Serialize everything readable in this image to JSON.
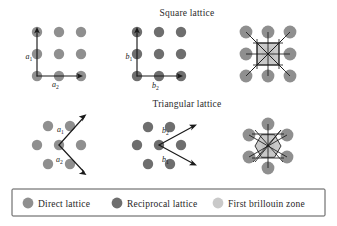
{
  "figure": {
    "width": 337,
    "height": 226,
    "background": "#ffffff"
  },
  "titles": {
    "square": "Square lattice",
    "triangular": "Triangular lattice"
  },
  "colors": {
    "direct_lattice": "#8f8f8f",
    "reciprocal_lattice": "#6e6e6e",
    "brillouin_zone": "#c9c9c9",
    "line": "#1a1a1a",
    "text": "#1f1f1f",
    "legend_border": "#555555",
    "background": "#ffffff"
  },
  "legend": {
    "items": [
      {
        "label": "Direct lattice",
        "color": "#8f8f8f",
        "swatch": "circle-swatch"
      },
      {
        "label": "Reciprocal lattice",
        "color": "#6e6e6e",
        "swatch": "circle-swatch"
      },
      {
        "label": "First brillouin zone",
        "color": "#c9c9c9",
        "swatch": "circle-swatch"
      }
    ]
  },
  "panels": [
    {
      "id": "square-direct",
      "row": "square",
      "kind": "direct",
      "dot_color": "#8f8f8f",
      "vectors": [
        {
          "name": "a",
          "sub": "1",
          "label": "a1",
          "dir": "up"
        },
        {
          "name": "a",
          "sub": "2",
          "label": "a2",
          "dir": "right"
        }
      ]
    },
    {
      "id": "square-reciprocal",
      "row": "square",
      "kind": "reciprocal",
      "dot_color": "#6e6e6e",
      "vectors": [
        {
          "name": "b",
          "sub": "1",
          "label": "b1",
          "dir": "up"
        },
        {
          "name": "b",
          "sub": "2",
          "label": "b2",
          "dir": "right"
        }
      ]
    },
    {
      "id": "square-brillouin",
      "row": "square",
      "kind": "brillouin",
      "dot_color": "#8f8f8f",
      "zone_color": "#c9c9c9",
      "zone_shape": "square",
      "neighbors": 8,
      "vectors": []
    },
    {
      "id": "triangular-direct",
      "row": "triangular",
      "kind": "direct",
      "dot_color": "#8f8f8f",
      "vectors": [
        {
          "name": "a",
          "sub": "1",
          "label": "a1",
          "dir": "up-right"
        },
        {
          "name": "a",
          "sub": "2",
          "label": "a2",
          "dir": "down-right"
        }
      ]
    },
    {
      "id": "triangular-reciprocal",
      "row": "triangular",
      "kind": "reciprocal",
      "dot_color": "#6e6e6e",
      "vectors": [
        {
          "name": "b",
          "sub": "2",
          "label": "b2",
          "dir": "up-right"
        },
        {
          "name": "b",
          "sub": "1",
          "label": "b1",
          "dir": "down-right"
        }
      ]
    },
    {
      "id": "triangular-brillouin",
      "row": "triangular",
      "kind": "brillouin",
      "dot_color": "#8f8f8f",
      "zone_color": "#c9c9c9",
      "zone_shape": "hexagon",
      "neighbors": 6,
      "vectors": []
    }
  ],
  "vector_labels": {
    "a1": {
      "base": "a",
      "sub": "1"
    },
    "a2": {
      "base": "a",
      "sub": "2"
    },
    "b1": {
      "base": "b",
      "sub": "1"
    },
    "b2": {
      "base": "b",
      "sub": "2"
    }
  }
}
